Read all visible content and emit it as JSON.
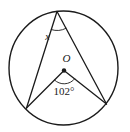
{
  "diagram": {
    "type": "circle-geometry",
    "background_color": "#ffffff",
    "stroke_color": "#1b1b1b",
    "circle": {
      "cx": 63.5,
      "cy": 68,
      "rx": 54.5,
      "ry": 57
    },
    "points": {
      "apex": {
        "x": 57,
        "y": 11.5
      },
      "left": {
        "x": 26.5,
        "y": 108
      },
      "right": {
        "x": 106.5,
        "y": 104
      },
      "center": {
        "x": 64,
        "y": 70.5
      }
    },
    "center_dot_radius": 2.2,
    "angle_arcs": {
      "inscribed": {
        "vertex": "apex",
        "toA": "left",
        "toB": "right",
        "radius": 19
      },
      "central": {
        "vertex": "center",
        "toA": "left",
        "toB": "right",
        "radius": 13.5
      }
    },
    "labels": {
      "inscribed": {
        "text": "x",
        "x": 47.5,
        "y": 40,
        "font_size": 10
      },
      "center": {
        "text": "O",
        "x": 66.5,
        "y": 61.5,
        "font_size": 11
      },
      "central": {
        "text": "102°",
        "x": 64,
        "y": 95,
        "font_size": 11
      }
    },
    "stroke_widths": {
      "circle": 1.4,
      "line": 1.3,
      "angle_arc": 0.9
    }
  }
}
